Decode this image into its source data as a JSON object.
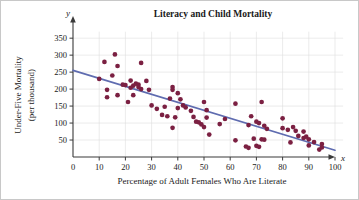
{
  "chart_data": {
    "type": "scatter",
    "title": "Literacy and Child Mortality",
    "xlabel": "Percentage of Adult Females Who Are Literate",
    "ylabel_line1": "Under-Five Mortality",
    "ylabel_line2": "(per thousand)",
    "x_axis_symbol": "x",
    "y_axis_symbol": "y",
    "xlim": [
      0,
      105
    ],
    "ylim": [
      0,
      375
    ],
    "xticks": [
      0,
      10,
      20,
      30,
      40,
      50,
      60,
      70,
      80,
      90,
      100
    ],
    "yticks": [
      50,
      100,
      150,
      200,
      250,
      300,
      350
    ],
    "grid": true,
    "legend": "none",
    "point_color": "#7b2042",
    "line_color": "#5f6cb0",
    "trendline": {
      "label": "least-squares regression line",
      "x_start": 0,
      "y_start": 255,
      "x_end": 100,
      "y_end": 20
    },
    "points": [
      [
        10,
        230
      ],
      [
        12,
        280
      ],
      [
        13,
        198
      ],
      [
        13,
        176
      ],
      [
        15,
        240
      ],
      [
        16,
        302
      ],
      [
        17,
        268
      ],
      [
        17,
        182
      ],
      [
        19,
        213
      ],
      [
        20,
        212
      ],
      [
        21,
        162
      ],
      [
        22,
        225
      ],
      [
        22,
        204
      ],
      [
        23,
        182
      ],
      [
        23,
        210
      ],
      [
        24,
        216
      ],
      [
        25,
        213
      ],
      [
        25,
        206
      ],
      [
        26,
        277
      ],
      [
        26,
        200
      ],
      [
        28,
        224
      ],
      [
        29,
        198
      ],
      [
        30,
        152
      ],
      [
        32,
        142
      ],
      [
        34,
        124
      ],
      [
        35,
        148
      ],
      [
        36,
        120
      ],
      [
        37,
        172
      ],
      [
        38,
        206
      ],
      [
        38,
        198
      ],
      [
        38,
        86
      ],
      [
        39,
        117
      ],
      [
        40,
        188
      ],
      [
        40,
        144
      ],
      [
        41,
        170
      ],
      [
        42,
        152
      ],
      [
        43,
        146
      ],
      [
        45,
        136
      ],
      [
        46,
        118
      ],
      [
        47,
        104
      ],
      [
        48,
        102
      ],
      [
        49,
        96
      ],
      [
        50,
        162
      ],
      [
        50,
        88
      ],
      [
        51,
        116
      ],
      [
        51,
        138
      ],
      [
        52,
        66
      ],
      [
        56,
        97
      ],
      [
        58,
        112
      ],
      [
        62,
        157
      ],
      [
        62,
        49
      ],
      [
        66,
        31
      ],
      [
        67,
        94
      ],
      [
        67,
        27
      ],
      [
        68,
        120
      ],
      [
        69,
        54
      ],
      [
        70,
        33
      ],
      [
        70,
        104
      ],
      [
        71,
        30
      ],
      [
        71,
        100
      ],
      [
        72,
        162
      ],
      [
        72,
        52
      ],
      [
        73,
        92
      ],
      [
        73,
        51
      ],
      [
        74,
        83
      ],
      [
        80,
        114
      ],
      [
        80,
        85
      ],
      [
        82,
        80
      ],
      [
        83,
        43
      ],
      [
        84,
        88
      ],
      [
        85,
        77
      ],
      [
        86,
        62
      ],
      [
        88,
        75
      ],
      [
        88,
        56
      ],
      [
        89,
        60
      ],
      [
        90,
        34
      ],
      [
        90,
        52
      ],
      [
        92,
        44
      ],
      [
        94,
        22
      ],
      [
        95,
        38
      ],
      [
        95,
        28
      ]
    ]
  }
}
